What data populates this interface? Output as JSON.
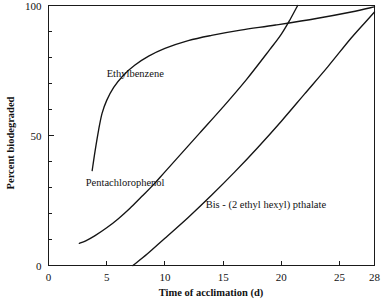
{
  "chart_data": {
    "type": "line",
    "title": "",
    "subtitle": "",
    "xlabel": "Time of acclimation (d)",
    "ylabel": "Percent biodegraded",
    "xlim": [
      0,
      28
    ],
    "ylim": [
      0,
      100
    ],
    "grid": false,
    "legend_position": "inline-annotations",
    "x_ticks": [
      0,
      5,
      10,
      15,
      20,
      25,
      28
    ],
    "x_tick_labels": [
      "0",
      "5",
      "10",
      "15",
      "20",
      "25",
      "28"
    ],
    "x_minor_ticks": [],
    "y_ticks": [
      0,
      50,
      100
    ],
    "y_tick_labels": [
      "0",
      "50",
      "100"
    ],
    "y_minor_ticks": [
      10,
      20,
      30,
      40,
      60,
      70,
      80,
      90
    ],
    "series": [
      {
        "name": "Ethylbenzene",
        "label": "Ethylbenzene",
        "label_x": 5.0,
        "label_y": 72.5,
        "points": [
          {
            "x": 3.75,
            "y": 36.5
          },
          {
            "x": 4.0,
            "y": 44.0
          },
          {
            "x": 4.3,
            "y": 52.0
          },
          {
            "x": 4.6,
            "y": 58.5
          },
          {
            "x": 5.0,
            "y": 63.5
          },
          {
            "x": 5.6,
            "y": 68.5
          },
          {
            "x": 6.4,
            "y": 73.0
          },
          {
            "x": 7.4,
            "y": 77.0
          },
          {
            "x": 8.6,
            "y": 80.5
          },
          {
            "x": 10.0,
            "y": 83.5
          },
          {
            "x": 12.0,
            "y": 86.5
          },
          {
            "x": 14.0,
            "y": 88.5
          },
          {
            "x": 16.5,
            "y": 90.5
          },
          {
            "x": 19.5,
            "y": 92.5
          },
          {
            "x": 23.0,
            "y": 95.0
          },
          {
            "x": 26.0,
            "y": 97.5
          },
          {
            "x": 28.0,
            "y": 99.5
          }
        ]
      },
      {
        "name": "Pentachlorophenol",
        "label": "Pentachlorophenol",
        "label_x": 3.2,
        "label_y": 30.5,
        "points": [
          {
            "x": 2.65,
            "y": 8.5
          },
          {
            "x": 3.2,
            "y": 9.5
          },
          {
            "x": 4.0,
            "y": 11.5
          },
          {
            "x": 5.0,
            "y": 14.5
          },
          {
            "x": 6.0,
            "y": 18.0
          },
          {
            "x": 7.0,
            "y": 22.0
          },
          {
            "x": 8.0,
            "y": 26.5
          },
          {
            "x": 9.0,
            "y": 31.0
          },
          {
            "x": 10.0,
            "y": 36.0
          },
          {
            "x": 11.5,
            "y": 43.5
          },
          {
            "x": 13.0,
            "y": 51.0
          },
          {
            "x": 15.0,
            "y": 61.0
          },
          {
            "x": 17.0,
            "y": 71.5
          },
          {
            "x": 19.0,
            "y": 83.0
          },
          {
            "x": 20.0,
            "y": 89.0
          },
          {
            "x": 20.8,
            "y": 95.0
          },
          {
            "x": 21.4,
            "y": 100.0
          }
        ]
      },
      {
        "name": "Bis - (2 ethyl hexyl) pthalate",
        "label": "Bis - (2 ethyl hexyl) pthalate",
        "label_x": 13.5,
        "label_y": 22.0,
        "points": [
          {
            "x": 7.25,
            "y": 0.0
          },
          {
            "x": 8.5,
            "y": 4.5
          },
          {
            "x": 10.0,
            "y": 10.5
          },
          {
            "x": 12.0,
            "y": 18.5
          },
          {
            "x": 14.0,
            "y": 27.0
          },
          {
            "x": 16.0,
            "y": 36.0
          },
          {
            "x": 18.0,
            "y": 45.5
          },
          {
            "x": 20.0,
            "y": 55.5
          },
          {
            "x": 22.0,
            "y": 66.0
          },
          {
            "x": 24.0,
            "y": 76.5
          },
          {
            "x": 26.0,
            "y": 87.5
          },
          {
            "x": 27.5,
            "y": 95.0
          },
          {
            "x": 28.0,
            "y": 97.5
          }
        ]
      }
    ]
  },
  "axes": {
    "x_title": "Time of acclimation (d)",
    "y_title": "Percent biodegraded"
  },
  "ticks": {
    "x": [
      "0",
      "5",
      "10",
      "15",
      "20",
      "25",
      "28"
    ],
    "y": [
      "0",
      "50",
      "100"
    ]
  },
  "labels": {
    "ethylbenzene": "Ethylbenzene",
    "pentachlorophenol": "Pentachlorophenol",
    "bis": "Bis - (2 ethyl hexyl) pthalate"
  },
  "colors": {
    "curve": "#141414",
    "axis": "#1a1a1a",
    "background": "#ffffff"
  }
}
